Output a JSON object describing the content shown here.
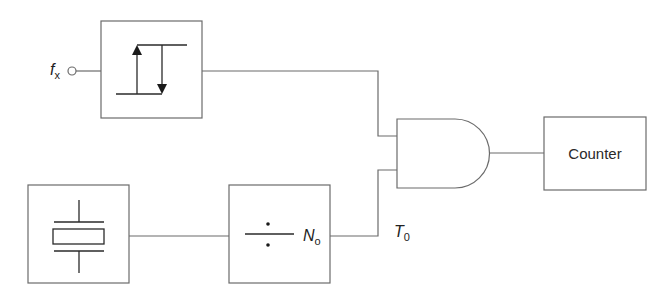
{
  "diagram": {
    "type": "block-diagram",
    "title": "",
    "input": {
      "label_main": "f",
      "label_sub": "x"
    },
    "blocks": [
      {
        "id": "schmitt-trigger",
        "label": "",
        "symbol": "hysteresis"
      },
      {
        "id": "crystal-oscillator",
        "label": "",
        "symbol": "quartz-crystal"
      },
      {
        "id": "frequency-divider",
        "label": "",
        "symbol": "division-sign",
        "annotation_main": "N",
        "annotation_sub": "o"
      },
      {
        "id": "and-gate",
        "label": "",
        "symbol": "and-gate"
      },
      {
        "id": "counter",
        "label": "Counter"
      }
    ],
    "signals": {
      "gate_time_main": "T",
      "gate_time_sub": "0"
    },
    "connections": [
      [
        "input",
        "schmitt-trigger"
      ],
      [
        "schmitt-trigger",
        "and-gate"
      ],
      [
        "crystal-oscillator",
        "frequency-divider"
      ],
      [
        "frequency-divider",
        "and-gate"
      ],
      [
        "and-gate",
        "counter"
      ]
    ],
    "colors": {
      "line": "#6b6b6b",
      "symbol": "#2a2a2a",
      "text": "#222222",
      "background": "#ffffff"
    }
  }
}
